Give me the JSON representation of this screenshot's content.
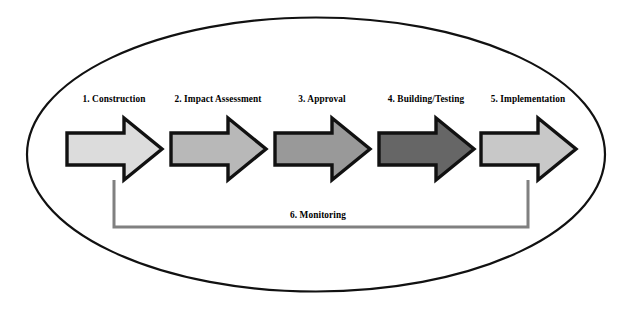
{
  "diagram": {
    "container_shape": "ellipse",
    "colors": {
      "ellipse_stroke": "#111111",
      "arrow_outline": "#111111",
      "loop_line": "#808080",
      "background": "#ffffff",
      "text": "#000000"
    },
    "stages": [
      {
        "label": "1. Construction",
        "fill": "#DCDCDC",
        "label_center_x": 114,
        "label_y": 94,
        "arrow_x": 67,
        "arrow_y": 118,
        "arrow_w": 95,
        "arrow_h": 62
      },
      {
        "label": "2. Impact Assessment",
        "fill": "#B8B8B8",
        "label_center_x": 218,
        "label_y": 94,
        "arrow_x": 171,
        "arrow_y": 118,
        "arrow_w": 95,
        "arrow_h": 62
      },
      {
        "label": "3. Approval",
        "fill": "#999999",
        "label_center_x": 322,
        "label_y": 94,
        "arrow_x": 275,
        "arrow_y": 118,
        "arrow_w": 95,
        "arrow_h": 62
      },
      {
        "label": "4. Building/Testing",
        "fill": "#666666",
        "label_center_x": 426,
        "label_y": 94,
        "arrow_x": 379,
        "arrow_y": 118,
        "arrow_w": 95,
        "arrow_h": 62
      },
      {
        "label": "5. Implementation",
        "fill": "#C8C8C8",
        "label_center_x": 528,
        "label_y": 94,
        "arrow_x": 481,
        "arrow_y": 118,
        "arrow_w": 95,
        "arrow_h": 62
      }
    ],
    "feedback": {
      "label": "6. Monitoring",
      "label_center_x": 318,
      "label_y": 210,
      "path": "M 114 180 L 114 227 L 528 227 L 528 180"
    },
    "ellipse": {
      "cx": 316,
      "cy": 154.5,
      "rx": 289,
      "ry": 137
    }
  }
}
